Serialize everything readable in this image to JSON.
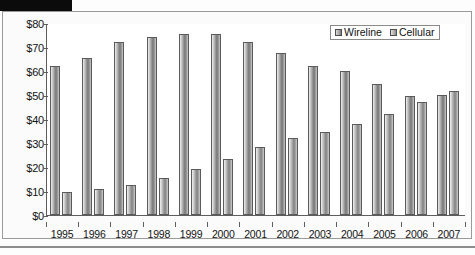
{
  "figure": {
    "title_bar_redacted": true
  },
  "legend": {
    "position": "top-right",
    "entries": [
      {
        "label": "Wireline",
        "swatch": "wireline"
      },
      {
        "label": "Cellular",
        "swatch": "cellular"
      }
    ]
  },
  "chart_data": {
    "type": "bar",
    "title": "",
    "xlabel": "",
    "ylabel": "",
    "ylim": [
      0,
      80
    ],
    "ytick_labels": [
      "$0",
      "$10",
      "$20",
      "$30",
      "$40",
      "$50",
      "$60",
      "$70",
      "$80"
    ],
    "ytick_values": [
      0,
      10,
      20,
      30,
      40,
      50,
      60,
      70,
      80
    ],
    "grid": false,
    "legend_position": "top-right",
    "categories": [
      "1995",
      "1996",
      "1997",
      "1998",
      "1999",
      "2000",
      "2001",
      "2002",
      "2003",
      "2004",
      "2005",
      "2006",
      "2007"
    ],
    "series": [
      {
        "name": "Wireline",
        "values": [
          62,
          65.5,
          72,
          74,
          75.5,
          75.5,
          72,
          67.5,
          62,
          60,
          54.5,
          49.5,
          50
        ]
      },
      {
        "name": "Cellular",
        "values": [
          9.5,
          11,
          12.5,
          15.5,
          19,
          23.5,
          28.5,
          32,
          34.5,
          38,
          42,
          47,
          51.5
        ]
      }
    ]
  }
}
